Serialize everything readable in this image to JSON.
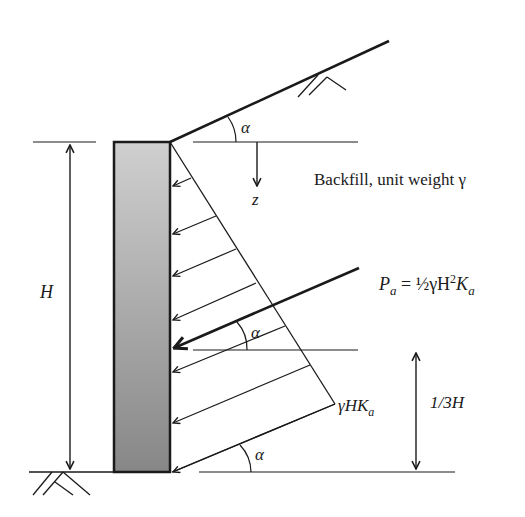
{
  "diagram": {
    "labels": {
      "alpha_top": "α",
      "alpha_mid": "α",
      "alpha_bottom": "α",
      "z_axis": "z",
      "backfill": "Backfill, unit weight γ",
      "height": "H",
      "resultant_P": "P",
      "resultant_sub": "a",
      "resultant_eq": " = ½γH",
      "resultant_sup": "2",
      "resultant_K": "K",
      "resultant_K_sub": "a",
      "base_pressure": "γHK",
      "base_pressure_sub": "a",
      "resultant_height": "1/3H"
    },
    "colors": {
      "line": "#1a1a1a",
      "wall_top": "#c8c8c8",
      "wall_bottom": "#8a8a8a",
      "background": "#ffffff"
    }
  }
}
